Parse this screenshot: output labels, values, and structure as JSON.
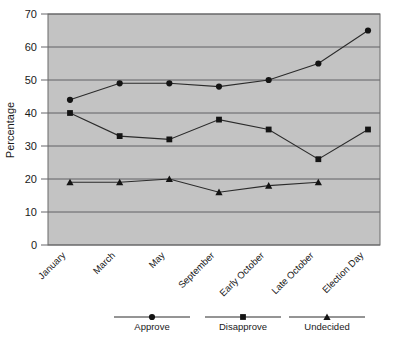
{
  "chart_data": {
    "type": "line",
    "title": "",
    "subtitle": "",
    "xlabel": "",
    "ylabel": "Percentage",
    "categories": [
      "January",
      "March",
      "May",
      "September",
      "Early October",
      "Late October",
      "Election Day"
    ],
    "series": [
      {
        "name": "Approve",
        "marker": "circle",
        "values": [
          44,
          49,
          49,
          48,
          50,
          55,
          65
        ]
      },
      {
        "name": "Disapprove",
        "marker": "square",
        "values": [
          40,
          33,
          32,
          38,
          35,
          26,
          35
        ]
      },
      {
        "name": "Undecided",
        "marker": "triangle",
        "values": [
          19,
          19,
          20,
          16,
          18,
          19,
          null
        ]
      }
    ],
    "ylim": [
      0,
      70
    ],
    "yticks": [
      0,
      10,
      20,
      30,
      40,
      50,
      60,
      70
    ],
    "ytick_labels": [
      "0",
      "10",
      "20",
      "30",
      "40",
      "50",
      "60",
      "70"
    ],
    "grid": true,
    "grid_axis": "y",
    "legend_position": "bottom",
    "plot_background": "#c3c3c3",
    "line_color": "#2b2b2b",
    "marker_color": "#141414",
    "grid_color": "#56565a"
  },
  "legend": {
    "items": [
      {
        "label": "Approve",
        "marker": "circle"
      },
      {
        "label": "Disapprove",
        "marker": "square"
      },
      {
        "label": "Undecided",
        "marker": "triangle"
      }
    ]
  },
  "axes": {
    "y_title": "Percentage",
    "y_ticks": [
      "70",
      "60",
      "50",
      "40",
      "30",
      "20",
      "10",
      "0"
    ],
    "x_ticks": [
      "January",
      "March",
      "May",
      "September",
      "Early October",
      "Late October",
      "Election Day"
    ]
  }
}
